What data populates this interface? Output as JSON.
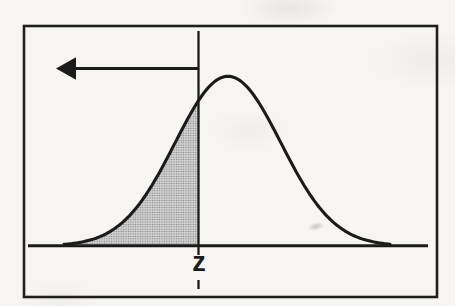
{
  "figure": {
    "kind": "scanned-textbook-statistics-figure",
    "caption_visible": false
  },
  "chart_data": {
    "type": "area",
    "xlabel": "",
    "ylabel": "",
    "grid": false,
    "legend": null,
    "x_axis": {
      "y_px": 245.8,
      "x1_px": 28,
      "x2_px": 428,
      "tick_labels": [
        "z"
      ]
    },
    "curve": {
      "shape": "gaussian",
      "center_px": 228,
      "sigma_px": 53,
      "baseline_y_px": 245.8,
      "amplitude_px": 169.5,
      "x_start_px": 64,
      "x_end_px": 390
    },
    "z_line": {
      "x_px": 198.5,
      "y_top_px": 31,
      "y_bottom_px": 255,
      "tick_y1_px": 280,
      "tick_y2_px": 289
    },
    "shaded_region": "area_under_curve_left_of_z",
    "arrow": {
      "direction": "left",
      "y_px": 68.5,
      "x_tail_px": 198.5,
      "x_tip_px": 56,
      "head_w_px": 20,
      "head_h_px": 22.5
    },
    "frame": {
      "x_px": 24,
      "y_px": 26,
      "w_px": 413,
      "h_px": 271
    },
    "colors": {
      "stroke": "#1b1b1b",
      "shade_base": "#cfcfcf",
      "shade_dot": "#808080",
      "frame": "#1f1f1f",
      "paper": "#f6f5f1"
    }
  }
}
